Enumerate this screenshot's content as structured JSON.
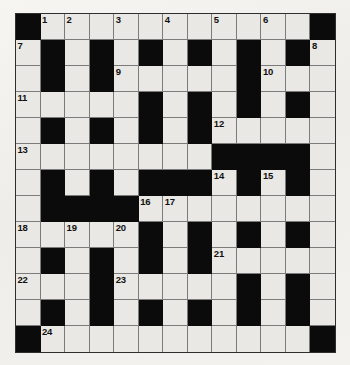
{
  "puzzle": {
    "kind": "crossword-grid",
    "rows": 13,
    "columns": 13,
    "colors": {
      "block": "#0b0b0b",
      "open_cell": "#e9e8e4",
      "grid_line": "#7b7b7b",
      "border": "#2e2e2e",
      "paper": "#f2f1ee",
      "number_text": "#111111"
    },
    "legend": {
      "1": "open cell (white)",
      "0": "blocked cell (black)"
    },
    "grid": [
      [
        0,
        1,
        1,
        1,
        1,
        1,
        1,
        1,
        1,
        1,
        1,
        1,
        0
      ],
      [
        1,
        0,
        1,
        0,
        1,
        0,
        1,
        0,
        1,
        0,
        1,
        0,
        1
      ],
      [
        1,
        0,
        1,
        0,
        1,
        1,
        1,
        1,
        1,
        0,
        1,
        1,
        1
      ],
      [
        1,
        1,
        1,
        1,
        1,
        0,
        1,
        0,
        1,
        0,
        1,
        0,
        1
      ],
      [
        1,
        0,
        1,
        0,
        1,
        0,
        1,
        0,
        1,
        1,
        1,
        1,
        1
      ],
      [
        1,
        1,
        1,
        1,
        1,
        1,
        1,
        1,
        0,
        0,
        0,
        0,
        1
      ],
      [
        1,
        0,
        1,
        0,
        1,
        0,
        0,
        0,
        1,
        0,
        1,
        0,
        1
      ],
      [
        1,
        0,
        0,
        0,
        0,
        1,
        1,
        1,
        1,
        1,
        1,
        1,
        1
      ],
      [
        1,
        1,
        1,
        1,
        1,
        0,
        1,
        0,
        1,
        0,
        1,
        0,
        1
      ],
      [
        1,
        0,
        1,
        0,
        1,
        0,
        1,
        0,
        1,
        1,
        1,
        1,
        1
      ],
      [
        1,
        1,
        1,
        0,
        1,
        1,
        1,
        1,
        1,
        0,
        1,
        0,
        1
      ],
      [
        1,
        0,
        1,
        0,
        1,
        0,
        1,
        0,
        1,
        0,
        1,
        0,
        1
      ],
      [
        0,
        1,
        1,
        1,
        1,
        1,
        1,
        1,
        1,
        1,
        1,
        1,
        0
      ]
    ],
    "numbers": [
      {
        "n": "1",
        "row": 0,
        "col": 1
      },
      {
        "n": "2",
        "row": 0,
        "col": 2
      },
      {
        "n": "3",
        "row": 0,
        "col": 4
      },
      {
        "n": "4",
        "row": 0,
        "col": 6
      },
      {
        "n": "5",
        "row": 0,
        "col": 8
      },
      {
        "n": "6",
        "row": 0,
        "col": 10
      },
      {
        "n": "7",
        "row": 1,
        "col": 0
      },
      {
        "n": "8",
        "row": 1,
        "col": 12
      },
      {
        "n": "9",
        "row": 2,
        "col": 4
      },
      {
        "n": "10",
        "row": 2,
        "col": 10
      },
      {
        "n": "11",
        "row": 3,
        "col": 0
      },
      {
        "n": "12",
        "row": 4,
        "col": 8
      },
      {
        "n": "13",
        "row": 5,
        "col": 0
      },
      {
        "n": "14",
        "row": 6,
        "col": 8
      },
      {
        "n": "15",
        "row": 6,
        "col": 10
      },
      {
        "n": "16",
        "row": 7,
        "col": 5
      },
      {
        "n": "17",
        "row": 7,
        "col": 6
      },
      {
        "n": "18",
        "row": 8,
        "col": 0
      },
      {
        "n": "19",
        "row": 8,
        "col": 2
      },
      {
        "n": "20",
        "row": 8,
        "col": 4
      },
      {
        "n": "21",
        "row": 9,
        "col": 8
      },
      {
        "n": "22",
        "row": 10,
        "col": 0
      },
      {
        "n": "23",
        "row": 10,
        "col": 4
      },
      {
        "n": "24",
        "row": 12,
        "col": 1
      }
    ]
  }
}
